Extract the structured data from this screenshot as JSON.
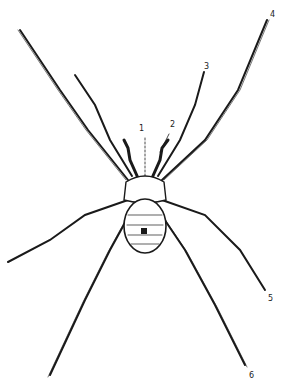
{
  "figure": {
    "labels": [
      {
        "id": "1",
        "text": "1",
        "x": 139,
        "y": 131
      },
      {
        "id": "2",
        "text": "2",
        "x": 170,
        "y": 127
      },
      {
        "id": "3",
        "text": "3",
        "x": 204,
        "y": 62
      },
      {
        "id": "4",
        "text": "4",
        "x": 270,
        "y": 10
      },
      {
        "id": "5",
        "text": "5",
        "x": 268,
        "y": 296
      },
      {
        "id": "6",
        "text": "6",
        "x": 249,
        "y": 372
      }
    ],
    "colors": {
      "ink": "#1a1a1a",
      "background": "#ffffff"
    }
  }
}
